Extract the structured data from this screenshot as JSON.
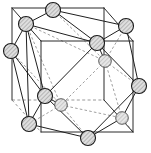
{
  "figure": {
    "caption": "",
    "background_color": "#ffffff",
    "line_color_solid": "#1f1f1f",
    "line_color_hidden": "#949494",
    "atom_fill_color": "#d8d8d8",
    "atom_stroke_color": "#1a1a1a",
    "atom_hatch_color": "#7a7a7a",
    "atom_count": 12,
    "atom_radius": 7.5,
    "cube_label": "unit cell cube",
    "polyhedron_label": "cuboctahedron"
  },
  "cube": {
    "front_face": [
      {
        "name": "front-top-left",
        "x": 41,
        "y": 41
      },
      {
        "name": "front-top-right",
        "x": 133,
        "y": 41
      },
      {
        "name": "front-bottom-right",
        "x": 133,
        "y": 132
      },
      {
        "name": "front-bottom-left",
        "x": 41,
        "y": 132
      }
    ],
    "back_face": [
      {
        "name": "back-top-left",
        "x": 12,
        "y": 8
      },
      {
        "name": "back-top-right",
        "x": 104,
        "y": 8
      },
      {
        "name": "back-bottom-right",
        "x": 104,
        "y": 100
      },
      {
        "name": "back-bottom-left",
        "x": 12,
        "y": 100
      }
    ],
    "hidden_corner": "back-bottom-left"
  },
  "atoms": [
    {
      "id": 1,
      "name": "atom-top-back",
      "x": 53,
      "y": 10,
      "depth": "back",
      "hidden": false
    },
    {
      "id": 2,
      "name": "atom-top-left",
      "x": 26,
      "y": 24,
      "depth": "front",
      "hidden": false
    },
    {
      "id": 3,
      "name": "atom-top-right",
      "x": 126,
      "y": 26,
      "depth": "back",
      "hidden": false
    },
    {
      "id": 4,
      "name": "atom-top-front",
      "x": 97,
      "y": 43,
      "depth": "front",
      "hidden": false
    },
    {
      "id": 5,
      "name": "atom-left-upper",
      "x": 11,
      "y": 51,
      "depth": "back",
      "hidden": false
    },
    {
      "id": 6,
      "name": "atom-center-right",
      "x": 105,
      "y": 61,
      "depth": "back",
      "hidden": true
    },
    {
      "id": 7,
      "name": "atom-right-middle",
      "x": 139,
      "y": 86,
      "depth": "front",
      "hidden": false
    },
    {
      "id": 8,
      "name": "atom-center-left",
      "x": 45,
      "y": 96,
      "depth": "front",
      "hidden": false
    },
    {
      "id": 9,
      "name": "atom-center-inner",
      "x": 61,
      "y": 105,
      "depth": "back",
      "hidden": true
    },
    {
      "id": 10,
      "name": "atom-bottom-left",
      "x": 29,
      "y": 124,
      "depth": "front",
      "hidden": false
    },
    {
      "id": 11,
      "name": "atom-bottom-right",
      "x": 122,
      "y": 118,
      "depth": "back",
      "hidden": true
    },
    {
      "id": 12,
      "name": "atom-bottom-front",
      "x": 88,
      "y": 138,
      "depth": "front",
      "hidden": false
    }
  ],
  "cube_edges_solid": [
    {
      "x1": 41,
      "y1": 41,
      "x2": 133,
      "y2": 41
    },
    {
      "x1": 133,
      "y1": 41,
      "x2": 133,
      "y2": 132
    },
    {
      "x1": 133,
      "y1": 132,
      "x2": 41,
      "y2": 132
    },
    {
      "x1": 41,
      "y1": 132,
      "x2": 41,
      "y2": 41
    },
    {
      "x1": 12,
      "y1": 8,
      "x2": 104,
      "y2": 8
    },
    {
      "x1": 104,
      "y1": 8,
      "x2": 104,
      "y2": 100
    },
    {
      "x1": 12,
      "y1": 8,
      "x2": 12,
      "y2": 100
    },
    {
      "x1": 12,
      "y1": 8,
      "x2": 41,
      "y2": 41
    },
    {
      "x1": 104,
      "y1": 8,
      "x2": 133,
      "y2": 41
    },
    {
      "x1": 104,
      "y1": 100,
      "x2": 133,
      "y2": 132
    }
  ],
  "cube_edges_dashed": [
    {
      "x1": 12,
      "y1": 100,
      "x2": 104,
      "y2": 100
    },
    {
      "x1": 12,
      "y1": 100,
      "x2": 41,
      "y2": 132
    }
  ],
  "poly_edges_solid": [
    {
      "x1": 53,
      "y1": 10,
      "x2": 26,
      "y2": 24
    },
    {
      "x1": 53,
      "y1": 10,
      "x2": 126,
      "y2": 26
    },
    {
      "x1": 53,
      "y1": 10,
      "x2": 97,
      "y2": 43
    },
    {
      "x1": 26,
      "y1": 24,
      "x2": 97,
      "y2": 43
    },
    {
      "x1": 126,
      "y1": 26,
      "x2": 97,
      "y2": 43
    },
    {
      "x1": 26,
      "y1": 24,
      "x2": 11,
      "y2": 51
    },
    {
      "x1": 11,
      "y1": 51,
      "x2": 29,
      "y2": 124
    },
    {
      "x1": 26,
      "y1": 24,
      "x2": 45,
      "y2": 96
    },
    {
      "x1": 26,
      "y1": 24,
      "x2": 29,
      "y2": 124
    },
    {
      "x1": 11,
      "y1": 51,
      "x2": 45,
      "y2": 96
    },
    {
      "x1": 126,
      "y1": 26,
      "x2": 139,
      "y2": 86
    },
    {
      "x1": 97,
      "y1": 43,
      "x2": 139,
      "y2": 86
    },
    {
      "x1": 97,
      "y1": 43,
      "x2": 45,
      "y2": 96
    },
    {
      "x1": 45,
      "y1": 96,
      "x2": 29,
      "y2": 124
    },
    {
      "x1": 45,
      "y1": 96,
      "x2": 88,
      "y2": 138
    },
    {
      "x1": 29,
      "y1": 124,
      "x2": 88,
      "y2": 138
    },
    {
      "x1": 88,
      "y1": 138,
      "x2": 139,
      "y2": 86
    },
    {
      "x1": 88,
      "y1": 138,
      "x2": 122,
      "y2": 118
    },
    {
      "x1": 122,
      "y1": 118,
      "x2": 139,
      "y2": 86
    },
    {
      "x1": 97,
      "y1": 43,
      "x2": 105,
      "y2": 61
    },
    {
      "x1": 45,
      "y1": 96,
      "x2": 61,
      "y2": 105
    }
  ],
  "poly_edges_dashed": [
    {
      "x1": 53,
      "y1": 10,
      "x2": 105,
      "y2": 61
    },
    {
      "x1": 26,
      "y1": 24,
      "x2": 105,
      "y2": 61
    },
    {
      "x1": 126,
      "y1": 26,
      "x2": 105,
      "y2": 61
    },
    {
      "x1": 105,
      "y1": 61,
      "x2": 122,
      "y2": 118
    },
    {
      "x1": 105,
      "y1": 61,
      "x2": 61,
      "y2": 105
    },
    {
      "x1": 105,
      "y1": 61,
      "x2": 139,
      "y2": 86
    },
    {
      "x1": 11,
      "y1": 51,
      "x2": 61,
      "y2": 105
    },
    {
      "x1": 61,
      "y1": 105,
      "x2": 122,
      "y2": 118
    },
    {
      "x1": 61,
      "y1": 105,
      "x2": 88,
      "y2": 138
    },
    {
      "x1": 61,
      "y1": 105,
      "x2": 29,
      "y2": 124
    },
    {
      "x1": 26,
      "y1": 24,
      "x2": 61,
      "y2": 105
    },
    {
      "x1": 122,
      "y1": 118,
      "x2": 133,
      "y2": 132
    }
  ]
}
